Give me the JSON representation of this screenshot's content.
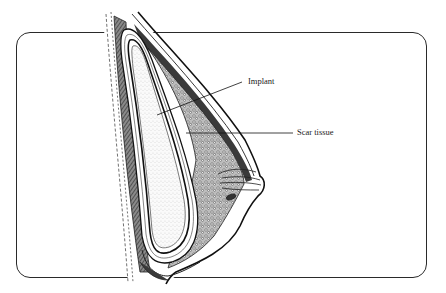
{
  "diagram": {
    "type": "anatomical-cross-section",
    "labels": [
      {
        "id": "implant",
        "text": "Implant"
      },
      {
        "id": "scar",
        "text": "Scar tissue"
      }
    ],
    "colors": {
      "ink": "#1a1a1a",
      "background": "#ffffff",
      "implant_fill": "#f2f2f2",
      "tissue_dark": "#3a3a3a"
    }
  }
}
